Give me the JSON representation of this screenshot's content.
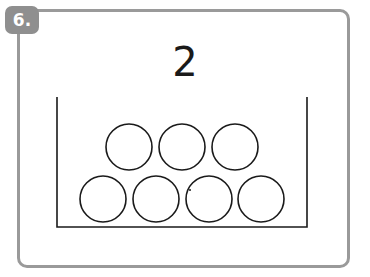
{
  "exercise": {
    "badge_label": "6.",
    "target_number": "2",
    "container": {
      "shape": "open-top box",
      "circles_top_row": 3,
      "circles_bottom_row": 4,
      "total_circles": 7
    },
    "colors": {
      "frame": "#9a9a9a",
      "badge": "#8f8f8f",
      "ink": "#1a1a1a"
    }
  }
}
